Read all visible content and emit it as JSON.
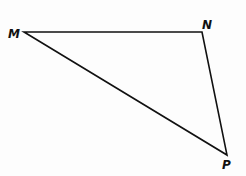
{
  "diagram": {
    "type": "triangle",
    "stroke_color": "#111111",
    "background": "#fdfdfd",
    "vertices": [
      {
        "name": "M",
        "x": 24,
        "y": 32,
        "label_x": 8,
        "label_y": 38
      },
      {
        "name": "N",
        "x": 202,
        "y": 32,
        "label_x": 202,
        "label_y": 29
      },
      {
        "name": "P",
        "x": 227,
        "y": 155,
        "label_x": 222,
        "label_y": 169
      }
    ],
    "sides": [
      {
        "from": "M",
        "to": "N"
      },
      {
        "from": "N",
        "to": "P"
      },
      {
        "from": "P",
        "to": "M"
      }
    ],
    "labels": {
      "m": "M",
      "n": "N",
      "p": "P"
    }
  }
}
